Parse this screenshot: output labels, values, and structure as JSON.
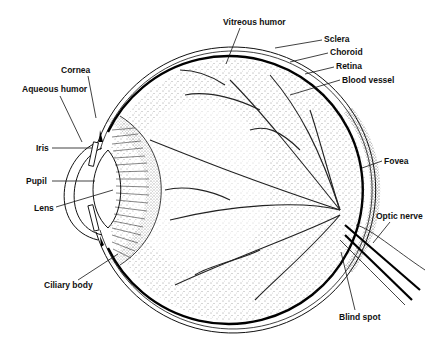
{
  "diagram": {
    "colors": {
      "ink": "#111111",
      "background": "#ffffff"
    },
    "labels": {
      "vitreous_humor": "Vitreous humor",
      "sclera": "Sclera",
      "choroid": "Choroid",
      "retina": "Retina",
      "blood_vessel": "Blood vessel",
      "cornea": "Cornea",
      "aqueous_humor": "Aqueous humor",
      "iris": "Iris",
      "pupil": "Pupil",
      "lens": "Lens",
      "fovea": "Fovea",
      "optic_nerve": "Optic nerve",
      "ciliary_body": "Ciliary body",
      "blind_spot": "Blind spot"
    }
  }
}
